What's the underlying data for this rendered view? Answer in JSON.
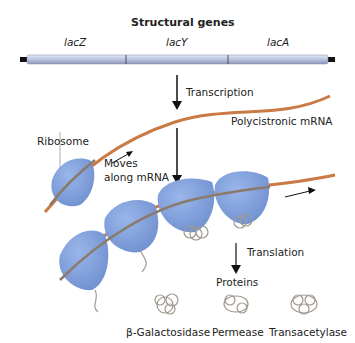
{
  "title": "Structural genes",
  "genes": [
    "lacZ",
    "lacY",
    "lacA"
  ],
  "labels": {
    "transcription": "Transcription",
    "mrna": "Polycistronic mRNA",
    "ribosome": "Ribosome",
    "moves_line1": "Moves",
    "moves_line2": "along mRNA",
    "translation": "Translation",
    "proteins": "Proteins"
  },
  "proteins": [
    "β-Galactosidase",
    "Permease",
    "Transacetylase"
  ],
  "colors": {
    "gene_bar": "#b9c3de",
    "mrna": "#c97a45",
    "ribosome": "#7f9fd8",
    "protein": "#a09a8e"
  }
}
